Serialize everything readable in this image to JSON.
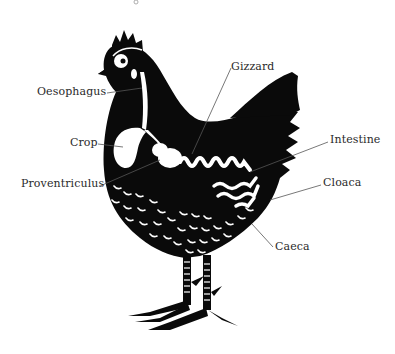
{
  "diagram": {
    "colors": {
      "silhouette": "#0a0a0a",
      "organ": "#ffffff",
      "leader_line": "#555555",
      "label_text": "#2a2a2a",
      "background": "#ffffff"
    },
    "labels": [
      {
        "id": "oesophagus",
        "text": "Oesophagus"
      },
      {
        "id": "crop",
        "text": "Crop"
      },
      {
        "id": "proventriculus",
        "text": "Proventriculus"
      },
      {
        "id": "gizzard",
        "text": "Gizzard"
      },
      {
        "id": "intestine",
        "text": "Intestine"
      },
      {
        "id": "cloaca",
        "text": "Cloaca"
      },
      {
        "id": "caeca",
        "text": "Caeca"
      }
    ]
  }
}
